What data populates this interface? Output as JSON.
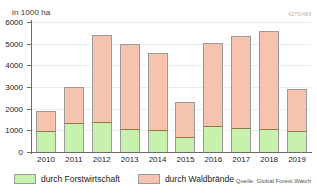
{
  "header": {
    "unit_label": "in 1000 ha",
    "image_id": "4275/48X"
  },
  "legend": {
    "items": [
      {
        "label": "durch Forstwirtschaft",
        "color": "#c9f1ae",
        "key": "forestry"
      },
      {
        "label": "durch Waldbrände",
        "color": "#f6c3ac",
        "key": "fire"
      }
    ]
  },
  "source": {
    "text": "Quelle: Global Forest Watch"
  },
  "axis": {
    "y_ticks": [
      "0",
      "1000",
      "2000",
      "3000",
      "4000",
      "5000",
      "6000"
    ],
    "x_ticks": [
      "2010",
      "2011",
      "2012",
      "2013",
      "2014",
      "2015",
      "2016",
      "2017",
      "2018",
      "2019"
    ]
  },
  "chart_data": {
    "type": "bar",
    "stacked": true,
    "title": "",
    "subtitle": "",
    "xlabel": "",
    "ylabel": "in 1000 ha",
    "ylim": [
      0,
      6000
    ],
    "ytick_values": [
      0,
      1000,
      2000,
      3000,
      4000,
      5000,
      6000
    ],
    "grid": true,
    "legend_position": "bottom-left",
    "categories": [
      "2010",
      "2011",
      "2012",
      "2013",
      "2014",
      "2015",
      "2016",
      "2017",
      "2018",
      "2019"
    ],
    "series": [
      {
        "name": "durch Forstwirtschaft",
        "color": "#c9f1ae",
        "values": [
          950,
          1350,
          1400,
          1050,
          1000,
          700,
          1200,
          1100,
          1050,
          950
        ]
      },
      {
        "name": "durch Waldbrände",
        "color": "#f6c3ac",
        "values": [
          950,
          1650,
          4000,
          3950,
          3550,
          1600,
          3850,
          4250,
          4550,
          1950
        ]
      }
    ],
    "totals": [
      1900,
      3000,
      5400,
      5000,
      4550,
      2300,
      5050,
      5350,
      5600,
      2900
    ]
  }
}
